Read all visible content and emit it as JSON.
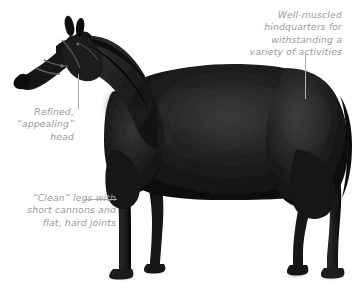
{
  "figure": {
    "background_color": "#ffffff",
    "text_color": "#9a9a9a",
    "leader_line_color": "#b0b0b0"
  },
  "annotations": {
    "hindquarters": {
      "text": "Well-muscled\nhindquarters for\nwithstanding a\nvariety of activities",
      "align": "right"
    },
    "head": {
      "text": "Refined,\n“appealing”\nhead",
      "align": "right"
    },
    "legs": {
      "text": "“Clean” legs with\nshort cannons and\nflat, hard joints",
      "align": "right"
    }
  }
}
